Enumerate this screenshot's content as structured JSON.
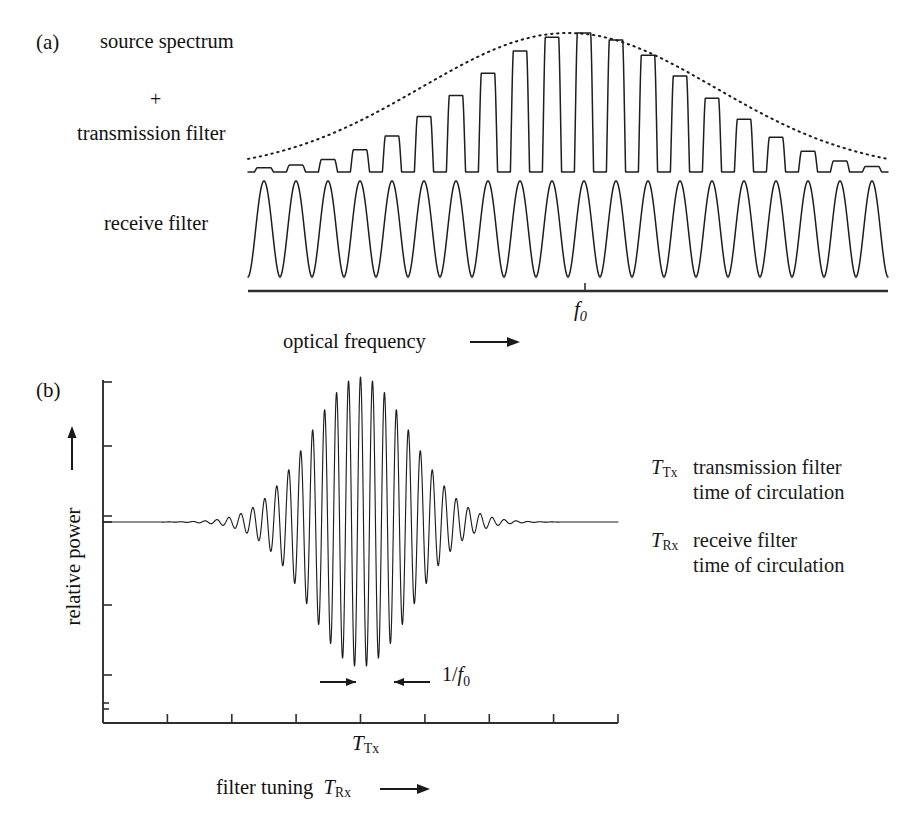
{
  "figure": {
    "panel_a": {
      "tag": "(a)",
      "labels": {
        "source_spectrum": "source spectrum",
        "plus": "+",
        "transmission_filter": "transmission filter",
        "receive_filter": "receive filter"
      },
      "axis": {
        "tick_label": "f0",
        "tick_label_base": "f",
        "tick_label_sub": "0",
        "xlabel": "optical frequency",
        "xlabel_arrow": "⟶"
      }
    },
    "panel_b": {
      "tag": "(b)",
      "ylabel": "relative power",
      "ylabel_arrow": "⟶",
      "xlabel": "filter tuning",
      "xlabel_symbol_base": "T",
      "xlabel_symbol_sub": "Rx",
      "xlabel_arrow": "⟶",
      "x_tick_label_base": "T",
      "x_tick_label_sub": "Tx",
      "annotation": {
        "label": "1/f0",
        "label_prefix": "1/",
        "label_base": "f",
        "label_sub": "0",
        "arrow_left": "⟶",
        "arrow_right": "⟵"
      }
    },
    "legend": [
      {
        "symbol_base": "T",
        "symbol_sub": "Tx",
        "line1": "transmission filter",
        "line2": "time of circulation"
      },
      {
        "symbol_base": "T",
        "symbol_sub": "Rx",
        "line1": "receive filter",
        "line2": "time of circulation"
      }
    ],
    "colors": {
      "ink": "#151515",
      "curve": "#202020",
      "axis": "#303030",
      "background": "#ffffff"
    }
  },
  "chart_data": [
    {
      "type": "line",
      "id": "panel-a-transmission",
      "title": "source spectrum + transmission filter",
      "xlabel": "optical frequency",
      "ylabel": "",
      "grid": false,
      "legend": "none",
      "xlim": [
        0,
        20
      ],
      "ylim": [
        0,
        1
      ],
      "description": "Frequency comb of narrow transmission peaks modulated by a Gaussian source-spectrum envelope (dotted).",
      "comb_line_count": 20,
      "comb_center_index": 9.5,
      "envelope": {
        "style": "dotted",
        "shape": "gaussian",
        "center": 9.5,
        "sigma": 4.6,
        "peak_value": 1.0
      },
      "categories": [
        1,
        2,
        3,
        4,
        5,
        6,
        7,
        8,
        9,
        10,
        11,
        12,
        13,
        14,
        15,
        16,
        17,
        18,
        19,
        20
      ],
      "values": [
        0.03,
        0.05,
        0.09,
        0.16,
        0.26,
        0.4,
        0.55,
        0.71,
        0.87,
        0.97,
        1.0,
        0.95,
        0.84,
        0.69,
        0.53,
        0.38,
        0.25,
        0.15,
        0.08,
        0.04
      ]
    },
    {
      "type": "line",
      "id": "panel-a-receive",
      "title": "receive filter",
      "xlabel": "optical frequency",
      "ylabel": "",
      "grid": false,
      "legend": "none",
      "xlim": [
        0,
        20
      ],
      "ylim": [
        0,
        1
      ],
      "description": "Periodic comb of broad equal-height receive filter passbands, one per comb line.",
      "lobe_count": 20,
      "categories": [
        1,
        2,
        3,
        4,
        5,
        6,
        7,
        8,
        9,
        10,
        11,
        12,
        13,
        14,
        15,
        16,
        17,
        18,
        19,
        20
      ],
      "values": [
        1,
        1,
        1,
        1,
        1,
        1,
        1,
        1,
        1,
        1,
        1,
        1,
        1,
        1,
        1,
        1,
        1,
        1,
        1,
        1
      ]
    },
    {
      "type": "line",
      "id": "panel-b-correlation",
      "title": "relative power vs filter tuning",
      "xlabel": "filter tuning T_Rx",
      "ylabel": "relative power",
      "grid": false,
      "legend": "none",
      "xlim": [
        0,
        8
      ],
      "ylim": [
        -1.15,
        1.15
      ],
      "x_tick_count": 8,
      "x_tick_labeled": {
        "position": 4,
        "label": "T_Tx"
      },
      "description": "Gaussian-enveloped oscillation centred at T_Tx; carrier period equals 1/f0.",
      "envelope": {
        "shape": "gaussian",
        "center": 4.0,
        "sigma": 0.78,
        "peak_value": 1.0
      },
      "carrier_period": 0.186,
      "x": [
        0.0,
        0.5,
        1.0,
        1.5,
        2.0,
        2.5,
        3.0,
        3.5,
        4.0,
        4.5,
        5.0,
        5.5,
        6.0,
        6.5,
        7.0,
        7.5,
        8.0
      ],
      "envelope_values": [
        0.0,
        0.0,
        0.002,
        0.01,
        0.04,
        0.15,
        0.45,
        0.84,
        1.0,
        0.84,
        0.45,
        0.15,
        0.04,
        0.01,
        0.002,
        0.0,
        0.0
      ]
    }
  ]
}
